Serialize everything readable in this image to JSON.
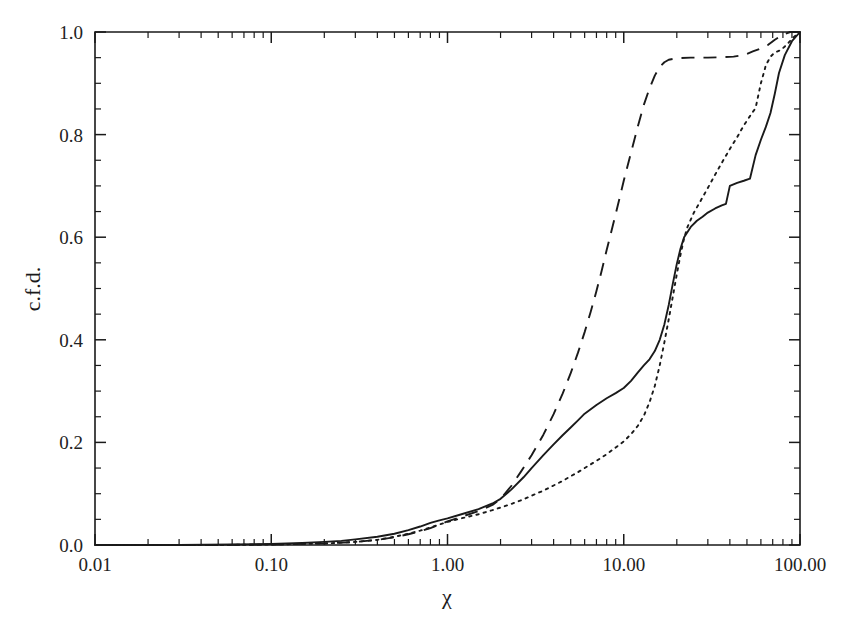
{
  "chart_data": {
    "type": "line",
    "title": "",
    "subtitle": "",
    "xlabel": "χ",
    "ylabel": "c.f.d.",
    "xscale": "log",
    "yscale": "linear",
    "xlim": [
      0.01,
      100.0
    ],
    "ylim": [
      0.0,
      1.0
    ],
    "grid": false,
    "legend": "none",
    "x_major_ticks": [
      0.01,
      0.1,
      1.0,
      10.0,
      100.0
    ],
    "x_tick_labels": [
      "0.01",
      "0.10",
      "1.00",
      "10.00",
      "100.00"
    ],
    "y_major_ticks": [
      0.0,
      0.2,
      0.4,
      0.6,
      0.8,
      1.0
    ],
    "y_tick_labels": [
      "0.0",
      "0.2",
      "0.4",
      "0.6",
      "0.8",
      "1.0"
    ],
    "y_minor_tick_step": 0.05,
    "series": [
      {
        "name": "solid",
        "style": "solid",
        "color": "#1a1a1a",
        "points": [
          [
            0.01,
            0.0
          ],
          [
            0.03,
            0.0
          ],
          [
            0.06,
            0.001
          ],
          [
            0.1,
            0.002
          ],
          [
            0.15,
            0.004
          ],
          [
            0.2,
            0.006
          ],
          [
            0.25,
            0.008
          ],
          [
            0.3,
            0.011
          ],
          [
            0.4,
            0.016
          ],
          [
            0.5,
            0.022
          ],
          [
            0.6,
            0.029
          ],
          [
            0.7,
            0.036
          ],
          [
            0.8,
            0.043
          ],
          [
            0.9,
            0.048
          ],
          [
            1.0,
            0.052
          ],
          [
            1.2,
            0.06
          ],
          [
            1.5,
            0.07
          ],
          [
            1.8,
            0.081
          ],
          [
            2.0,
            0.09
          ],
          [
            2.3,
            0.108
          ],
          [
            2.7,
            0.132
          ],
          [
            3.0,
            0.15
          ],
          [
            3.5,
            0.175
          ],
          [
            4.0,
            0.196
          ],
          [
            4.5,
            0.214
          ],
          [
            5.0,
            0.229
          ],
          [
            5.5,
            0.243
          ],
          [
            6.0,
            0.256
          ],
          [
            7.0,
            0.273
          ],
          [
            8.0,
            0.286
          ],
          [
            9.0,
            0.296
          ],
          [
            10.0,
            0.306
          ],
          [
            11.0,
            0.32
          ],
          [
            12.0,
            0.336
          ],
          [
            13.0,
            0.35
          ],
          [
            14.0,
            0.362
          ],
          [
            15.0,
            0.378
          ],
          [
            16.0,
            0.4
          ],
          [
            17.0,
            0.43
          ],
          [
            18.0,
            0.468
          ],
          [
            19.0,
            0.51
          ],
          [
            20.0,
            0.548
          ],
          [
            21.0,
            0.578
          ],
          [
            22.0,
            0.6
          ],
          [
            24.0,
            0.62
          ],
          [
            26.0,
            0.632
          ],
          [
            28.0,
            0.64
          ],
          [
            30.0,
            0.648
          ],
          [
            33.0,
            0.656
          ],
          [
            36.0,
            0.662
          ],
          [
            38.0,
            0.665
          ],
          [
            40.0,
            0.7
          ],
          [
            44.0,
            0.706
          ],
          [
            48.0,
            0.71
          ],
          [
            52.0,
            0.714
          ],
          [
            56.0,
            0.76
          ],
          [
            60.0,
            0.79
          ],
          [
            64.0,
            0.815
          ],
          [
            68.0,
            0.842
          ],
          [
            72.0,
            0.88
          ],
          [
            76.0,
            0.92
          ],
          [
            82.0,
            0.955
          ],
          [
            90.0,
            0.982
          ],
          [
            100.0,
            1.0
          ]
        ]
      },
      {
        "name": "dashed",
        "style": "dashed",
        "color": "#1a1a1a",
        "points": [
          [
            0.01,
            0.0
          ],
          [
            0.05,
            0.0
          ],
          [
            0.1,
            0.001
          ],
          [
            0.2,
            0.003
          ],
          [
            0.3,
            0.006
          ],
          [
            0.4,
            0.01
          ],
          [
            0.5,
            0.015
          ],
          [
            0.6,
            0.021
          ],
          [
            0.7,
            0.027
          ],
          [
            0.8,
            0.033
          ],
          [
            0.9,
            0.04
          ],
          [
            1.0,
            0.046
          ],
          [
            1.2,
            0.055
          ],
          [
            1.5,
            0.066
          ],
          [
            1.8,
            0.078
          ],
          [
            2.0,
            0.09
          ],
          [
            2.3,
            0.115
          ],
          [
            2.6,
            0.142
          ],
          [
            3.0,
            0.175
          ],
          [
            3.5,
            0.215
          ],
          [
            4.0,
            0.255
          ],
          [
            4.5,
            0.295
          ],
          [
            5.0,
            0.335
          ],
          [
            5.5,
            0.375
          ],
          [
            6.0,
            0.415
          ],
          [
            6.5,
            0.455
          ],
          [
            7.0,
            0.495
          ],
          [
            7.5,
            0.535
          ],
          [
            8.0,
            0.575
          ],
          [
            9.0,
            0.645
          ],
          [
            10.0,
            0.71
          ],
          [
            11.0,
            0.765
          ],
          [
            12.0,
            0.815
          ],
          [
            13.0,
            0.858
          ],
          [
            14.0,
            0.89
          ],
          [
            15.0,
            0.915
          ],
          [
            16.0,
            0.932
          ],
          [
            17.0,
            0.941
          ],
          [
            18.0,
            0.946
          ],
          [
            20.0,
            0.949
          ],
          [
            24.0,
            0.95
          ],
          [
            30.0,
            0.95
          ],
          [
            36.0,
            0.951
          ],
          [
            42.0,
            0.952
          ],
          [
            48.0,
            0.955
          ],
          [
            54.0,
            0.962
          ],
          [
            60.0,
            0.968
          ],
          [
            66.0,
            0.975
          ],
          [
            72.0,
            0.985
          ],
          [
            80.0,
            0.995
          ],
          [
            88.0,
            1.0
          ],
          [
            100.0,
            1.0
          ]
        ]
      },
      {
        "name": "dotted",
        "style": "dotted",
        "color": "#1a1a1a",
        "points": [
          [
            0.01,
            0.0
          ],
          [
            0.05,
            0.0
          ],
          [
            0.1,
            0.001
          ],
          [
            0.2,
            0.003
          ],
          [
            0.3,
            0.006
          ],
          [
            0.4,
            0.01
          ],
          [
            0.5,
            0.016
          ],
          [
            0.6,
            0.022
          ],
          [
            0.7,
            0.028
          ],
          [
            0.8,
            0.034
          ],
          [
            0.9,
            0.04
          ],
          [
            1.0,
            0.045
          ],
          [
            1.2,
            0.052
          ],
          [
            1.5,
            0.06
          ],
          [
            1.8,
            0.068
          ],
          [
            2.0,
            0.073
          ],
          [
            2.3,
            0.08
          ],
          [
            2.7,
            0.089
          ],
          [
            3.0,
            0.096
          ],
          [
            3.5,
            0.106
          ],
          [
            4.0,
            0.116
          ],
          [
            4.5,
            0.125
          ],
          [
            5.0,
            0.134
          ],
          [
            5.5,
            0.142
          ],
          [
            6.0,
            0.15
          ],
          [
            7.0,
            0.164
          ],
          [
            8.0,
            0.177
          ],
          [
            9.0,
            0.19
          ],
          [
            10.0,
            0.202
          ],
          [
            11.0,
            0.216
          ],
          [
            12.0,
            0.232
          ],
          [
            13.0,
            0.252
          ],
          [
            14.0,
            0.278
          ],
          [
            15.0,
            0.31
          ],
          [
            16.0,
            0.35
          ],
          [
            17.0,
            0.395
          ],
          [
            18.0,
            0.44
          ],
          [
            19.0,
            0.485
          ],
          [
            20.0,
            0.528
          ],
          [
            21.0,
            0.566
          ],
          [
            22.0,
            0.598
          ],
          [
            23.0,
            0.62
          ],
          [
            25.0,
            0.648
          ],
          [
            27.0,
            0.668
          ],
          [
            30.0,
            0.696
          ],
          [
            33.0,
            0.722
          ],
          [
            36.0,
            0.745
          ],
          [
            40.0,
            0.772
          ],
          [
            44.0,
            0.795
          ],
          [
            48.0,
            0.818
          ],
          [
            52.0,
            0.836
          ],
          [
            56.0,
            0.852
          ],
          [
            60.0,
            0.9
          ],
          [
            64.0,
            0.935
          ],
          [
            68.0,
            0.952
          ],
          [
            72.0,
            0.96
          ],
          [
            78.0,
            0.965
          ],
          [
            84.0,
            0.975
          ],
          [
            92.0,
            0.99
          ],
          [
            100.0,
            1.0
          ]
        ]
      }
    ]
  },
  "axes": {
    "x_title": "χ",
    "y_title": "c.f.d."
  }
}
